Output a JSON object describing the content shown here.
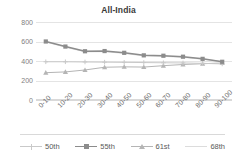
{
  "chart_data": {
    "type": "line",
    "title": "All-India",
    "xlabel": "",
    "ylabel": "",
    "ylim": [
      0,
      800
    ],
    "yticks": [
      0,
      200,
      400,
      600,
      800
    ],
    "grid": true,
    "legend_position": "bottom",
    "categories": [
      "0-10",
      "10-20",
      "20-30",
      "30-40",
      "40-50",
      "50-60",
      "60-70",
      "70-80",
      "80-90",
      "90-100"
    ],
    "series": [
      {
        "name": "50th",
        "color": "#c9c9c9",
        "marker": "cross",
        "values": [
          392,
          392,
          390,
          388,
          386,
          384,
          382,
          380,
          376,
          370
        ]
      },
      {
        "name": "55th",
        "color": "#8c8c8c",
        "marker": "square",
        "values": [
          600,
          548,
          500,
          502,
          484,
          458,
          454,
          444,
          422,
          392
        ]
      },
      {
        "name": "61st",
        "color": "#b5b5b5",
        "marker": "triangle",
        "values": [
          280,
          288,
          308,
          336,
          340,
          338,
          352,
          364,
          372,
          380
        ]
      },
      {
        "name": "68th",
        "color": "#dcdcdc",
        "marker": "none",
        "values": [
          595,
          542,
          494,
          496,
          478,
          452,
          448,
          438,
          418,
          396
        ]
      }
    ]
  },
  "colors": {
    "title": "#3a3a3a",
    "gridline": "#e4e4e4",
    "tick_label": "#808080",
    "x_tick_label": "#6e6e6e",
    "legend_label": "#5a5a5a",
    "background": "#ffffff"
  }
}
